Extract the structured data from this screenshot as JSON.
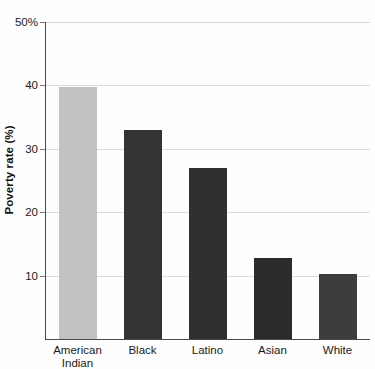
{
  "chart_data": {
    "type": "bar",
    "title": "",
    "xlabel": "",
    "ylabel": "Poverty rate (%)",
    "categories": [
      "American Indian",
      "Black",
      "Latino",
      "Asian",
      "White"
    ],
    "category_lines": [
      [
        "American",
        "Indian"
      ],
      [
        "Black"
      ],
      [
        "Latino"
      ],
      [
        "Asian"
      ],
      [
        "White"
      ]
    ],
    "values": [
      39.8,
      33,
      27,
      12.8,
      10.3
    ],
    "bar_colors": [
      "#c2c2c2",
      "#333333",
      "#303030",
      "#2b2b2b",
      "#3d3d3d"
    ],
    "ylim": [
      0,
      50
    ],
    "ytick_values": [
      50,
      40,
      30,
      20,
      10
    ],
    "ytick_labels": [
      "50%",
      "40",
      "30",
      "20",
      "10"
    ],
    "grid": true,
    "grid_axis": "y",
    "legend": "none",
    "axis_color": "#4a4a4a",
    "gridline_color": "#dcdcdc",
    "background": "#fefefe"
  }
}
